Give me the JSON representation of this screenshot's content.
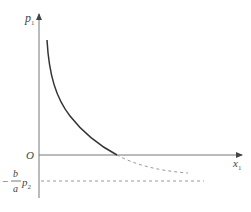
{
  "diagram": {
    "y_axis": {
      "label_main": "p",
      "label_sub": "1"
    },
    "x_axis": {
      "label_main": "x",
      "label_sub": "1"
    },
    "origin_label": "O",
    "intercept_label": {
      "minus": "−",
      "numerator": "b",
      "denominator": "a",
      "var_main": "p",
      "var_sub": "2"
    },
    "colors": {
      "axis": "#666666",
      "curve": "#333333",
      "dashed": "#999999"
    }
  }
}
